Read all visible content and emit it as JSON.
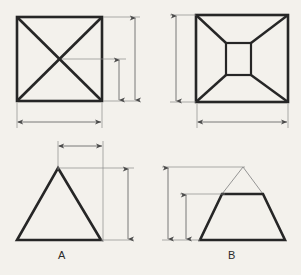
{
  "drawing": {
    "title": "Pyramid and truncated pyramid orthographic views",
    "background_color": "#f3f1ec",
    "object_line_color": "#262626",
    "dimension_line_color": "#6b6b6b",
    "thin_line_color": "#8a8a8a",
    "object_line_width": 2.6,
    "dimension_line_width": 0.9,
    "thin_line_width": 0.7
  },
  "figures": [
    {
      "id": "figure-a",
      "label": "A",
      "label_x": 62,
      "label_y": 259,
      "description": "pyramid",
      "plan_view": {
        "name": "plan-view-a",
        "shape": "square-with-diagonals",
        "x": 17,
        "y": 17,
        "width": 85,
        "height": 84
      },
      "elevation_view": {
        "name": "elevation-view-a",
        "shape": "triangle",
        "apex_x": 58,
        "apex_y": 168,
        "base_left_x": 17,
        "base_right_x": 101,
        "base_y": 240
      }
    },
    {
      "id": "figure-b",
      "label": "B",
      "label_x": 232,
      "label_y": 259,
      "description": "truncated pyramid",
      "plan_view": {
        "name": "plan-view-b",
        "shape": "square-with-inner-square",
        "x": 196,
        "y": 15,
        "width": 92,
        "height": 87,
        "inner_x": 226,
        "inner_y": 43,
        "inner_width": 25,
        "inner_height": 32
      },
      "elevation_view": {
        "name": "elevation-view-b",
        "shape": "trapezoid-with-apex-construction",
        "base_left_x": 200,
        "base_right_x": 285,
        "base_y": 240,
        "top_left_x": 222,
        "top_right_x": 263,
        "top_y": 194,
        "apex_x": 243,
        "apex_y": 167
      }
    }
  ],
  "dimensions": [
    {
      "name": "dim-plan-a-height-full",
      "orientation": "vertical",
      "x": 135,
      "y1": 17,
      "y2": 101,
      "extension_y": [
        17,
        101
      ],
      "extension_x1": 103,
      "extension_x2": 140
    },
    {
      "name": "dim-plan-a-height-half",
      "orientation": "vertical",
      "x": 119,
      "y1": 59,
      "y2": 101,
      "extension_y": [
        59
      ],
      "extension_x1": 62,
      "extension_x2": 126
    },
    {
      "name": "dim-plan-a-width",
      "orientation": "horizontal",
      "y": 122,
      "x1": 17,
      "x2": 101,
      "extension_x": [
        17,
        101
      ],
      "extension_y1": 103,
      "extension_y2": 128
    },
    {
      "name": "dim-plan-b-height",
      "orientation": "vertical",
      "x": 176,
      "y1": 15,
      "y2": 102,
      "extension_y": [
        15,
        102
      ],
      "extension_x1": 170,
      "extension_x2": 196
    },
    {
      "name": "dim-plan-b-width",
      "orientation": "horizontal",
      "y": 122,
      "x1": 198,
      "x2": 288,
      "extension_x": [
        198,
        288
      ],
      "extension_y1": 104,
      "extension_y2": 128
    },
    {
      "name": "dim-elev-a-top-width",
      "orientation": "horizontal",
      "y": 146,
      "x1": 58,
      "x2": 103,
      "extension_x": [
        58,
        103
      ],
      "extension_y1": 141,
      "extension_y2": 170
    },
    {
      "name": "dim-elev-a-height",
      "orientation": "vertical",
      "x": 128,
      "y1": 168,
      "y2": 240,
      "extension_y": [
        168,
        240
      ],
      "extension_x1": 58,
      "extension_x2": 134
    },
    {
      "name": "dim-elev-b-full-height",
      "orientation": "vertical",
      "x": 168,
      "y1": 167,
      "y2": 240,
      "extension_y": [
        167,
        240
      ],
      "extension_x1": 162,
      "extension_x2": 245
    },
    {
      "name": "dim-elev-b-trunc-height",
      "orientation": "vertical",
      "x": 186,
      "y1": 194,
      "y2": 240,
      "extension_y": [
        194
      ],
      "extension_x1": 180,
      "extension_x2": 225
    }
  ]
}
